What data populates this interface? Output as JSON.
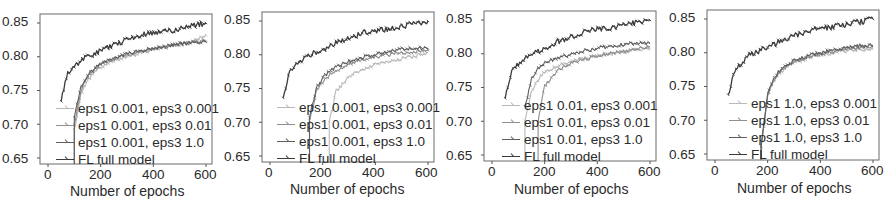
{
  "figure": {
    "y_ticks": [
      "0.85",
      "0.80",
      "0.75",
      "0.70",
      "0.65"
    ],
    "x_ticks": [
      "0",
      "200",
      "400",
      "600"
    ],
    "xlabel": "Number of epochs"
  },
  "series_colors": [
    "#b8b8b8",
    "#8f8f8f",
    "#5e5e5e",
    "#3c3c3c"
  ],
  "chart_data": [
    {
      "type": "line",
      "title": "",
      "xlabel": "Number of epochs",
      "ylabel": "",
      "xlim": [
        -30,
        620
      ],
      "ylim": [
        0.64,
        0.86
      ],
      "grid": false,
      "legend_position": "lower right (inside)",
      "x": [
        50,
        75,
        100,
        125,
        150,
        175,
        200,
        250,
        300,
        350,
        400,
        450,
        500,
        550,
        600
      ],
      "series": [
        {
          "name": "eps1 0.001, eps3 0.001",
          "values": [
            null,
            null,
            0.69,
            0.745,
            0.765,
            0.776,
            0.785,
            0.795,
            0.8,
            0.806,
            0.81,
            0.814,
            0.818,
            0.823,
            0.832
          ]
        },
        {
          "name": "eps1 0.001, eps3 0.01",
          "values": [
            null,
            null,
            0.7,
            0.75,
            0.77,
            0.78,
            0.788,
            0.797,
            0.803,
            0.808,
            0.812,
            0.815,
            0.818,
            0.821,
            0.824
          ]
        },
        {
          "name": "eps1 0.001, eps3 1.0",
          "values": [
            null,
            null,
            0.71,
            0.755,
            0.772,
            0.782,
            0.79,
            0.798,
            0.804,
            0.809,
            0.813,
            0.816,
            0.819,
            0.821,
            0.822
          ]
        },
        {
          "name": "FL full model",
          "values": [
            0.738,
            0.775,
            0.785,
            0.795,
            0.8,
            0.805,
            0.808,
            0.818,
            0.825,
            0.832,
            0.836,
            0.838,
            0.842,
            0.846,
            0.85
          ]
        }
      ],
      "legend": [
        "eps1 0.001, eps3 0.001",
        "eps1 0.001, eps3 0.01",
        "eps1 0.001, eps3 1.0",
        "FL full model"
      ]
    },
    {
      "type": "line",
      "title": "",
      "xlabel": "Number of epochs",
      "ylabel": "",
      "xlim": [
        -30,
        620
      ],
      "ylim": [
        0.64,
        0.86
      ],
      "grid": false,
      "legend_position": "lower right (inside)",
      "x": [
        50,
        75,
        100,
        125,
        150,
        175,
        200,
        225,
        250,
        300,
        350,
        400,
        450,
        500,
        550,
        600
      ],
      "series": [
        {
          "name": "eps1 0.001, eps3 0.001",
          "values": [
            null,
            null,
            null,
            null,
            null,
            null,
            null,
            0.7,
            0.745,
            0.768,
            0.778,
            0.786,
            0.79,
            0.794,
            0.798,
            0.803
          ]
        },
        {
          "name": "eps1 0.001, eps3 0.01",
          "values": [
            null,
            null,
            null,
            null,
            0.7,
            0.745,
            0.76,
            0.77,
            0.776,
            0.786,
            0.792,
            0.797,
            0.8,
            0.803,
            0.805,
            0.807
          ]
        },
        {
          "name": "eps1 0.001, eps3 1.0",
          "values": [
            null,
            null,
            null,
            null,
            0.705,
            0.75,
            0.765,
            0.775,
            0.781,
            0.79,
            0.796,
            0.801,
            0.805,
            0.808,
            0.81,
            0.809
          ]
        },
        {
          "name": "FL full model",
          "values": [
            0.738,
            0.775,
            0.785,
            0.795,
            0.8,
            0.804,
            0.808,
            0.812,
            0.818,
            0.825,
            0.832,
            0.836,
            0.838,
            0.842,
            0.846,
            0.85
          ]
        }
      ],
      "legend": [
        "eps1 0.001, eps3 0.001",
        "eps1 0.001, eps3 0.01",
        "eps1 0.001, eps3 1.0",
        "FL full model"
      ]
    },
    {
      "type": "line",
      "title": "",
      "xlabel": "Number of epochs",
      "ylabel": "",
      "xlim": [
        -30,
        620
      ],
      "ylim": [
        0.64,
        0.86
      ],
      "grid": false,
      "legend_position": "lower right (inside)",
      "x": [
        50,
        75,
        100,
        125,
        150,
        175,
        200,
        250,
        300,
        350,
        400,
        450,
        500,
        550,
        600
      ],
      "series": [
        {
          "name": "eps1 0.01, eps3 0.001",
          "values": [
            null,
            null,
            null,
            0.7,
            0.745,
            0.762,
            0.772,
            0.782,
            0.788,
            0.793,
            0.797,
            0.8,
            0.803,
            0.806,
            0.808
          ]
        },
        {
          "name": "eps1 0.01, eps3 0.01",
          "values": [
            null,
            null,
            null,
            null,
            null,
            0.7,
            0.752,
            0.775,
            0.785,
            0.792,
            0.797,
            0.801,
            0.804,
            0.808,
            0.811
          ]
        },
        {
          "name": "eps1 0.01, eps3 1.0",
          "values": [
            null,
            null,
            null,
            0.72,
            0.762,
            0.778,
            0.786,
            0.794,
            0.799,
            0.804,
            0.808,
            0.811,
            0.814,
            0.816,
            0.815
          ]
        },
        {
          "name": "FL full model",
          "values": [
            0.738,
            0.775,
            0.785,
            0.795,
            0.8,
            0.804,
            0.808,
            0.818,
            0.825,
            0.832,
            0.836,
            0.838,
            0.842,
            0.846,
            0.85
          ]
        }
      ],
      "legend": [
        "eps1 0.01, eps3 0.001",
        "eps1 0.01, eps3 0.01",
        "eps1 0.01, eps3 1.0",
        "FL full model"
      ]
    },
    {
      "type": "line",
      "title": "",
      "xlabel": "Number of epochs",
      "ylabel": "",
      "xlim": [
        -30,
        620
      ],
      "ylim": [
        0.64,
        0.86
      ],
      "grid": false,
      "legend_position": "lower right (inside)",
      "x": [
        50,
        75,
        100,
        125,
        150,
        175,
        200,
        225,
        250,
        300,
        350,
        400,
        450,
        500,
        550,
        600
      ],
      "series": [
        {
          "name": "eps1 1.0, eps3 0.001",
          "values": [
            0.712,
            null,
            null,
            null,
            null,
            0.66,
            0.735,
            0.76,
            0.772,
            0.785,
            0.792,
            0.797,
            0.8,
            0.803,
            0.805,
            0.806
          ]
        },
        {
          "name": "eps1 1.0, eps3 0.01",
          "values": [
            null,
            null,
            null,
            null,
            null,
            0.66,
            0.738,
            0.762,
            0.774,
            0.786,
            0.793,
            0.798,
            0.801,
            0.805,
            0.808,
            0.809
          ]
        },
        {
          "name": "eps1 1.0, eps3 1.0",
          "values": [
            null,
            null,
            null,
            null,
            null,
            0.66,
            0.74,
            0.764,
            0.776,
            0.788,
            0.795,
            0.8,
            0.804,
            0.808,
            0.811,
            0.811
          ]
        },
        {
          "name": "FL full model",
          "values": [
            0.738,
            0.775,
            0.785,
            0.795,
            0.8,
            0.804,
            0.808,
            0.812,
            0.818,
            0.825,
            0.832,
            0.836,
            0.838,
            0.842,
            0.846,
            0.85
          ]
        }
      ],
      "legend": [
        "eps1 1.0, eps3 0.001",
        "eps1 1.0, eps3 0.01",
        "eps1 1.0, eps3 1.0",
        "FL full model"
      ]
    }
  ]
}
